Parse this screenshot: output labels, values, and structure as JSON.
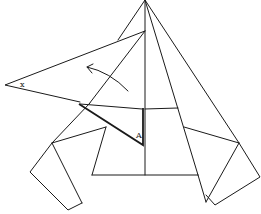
{
  "diagram": {
    "type": "origami-fold-step",
    "labels": {
      "flap_corner": "x",
      "point_a": "A"
    },
    "arrow": {
      "meaning": "fold-direction",
      "direction": "up-left"
    },
    "colors": {
      "line": "#1a1a1a",
      "background": "#ffffff"
    }
  }
}
